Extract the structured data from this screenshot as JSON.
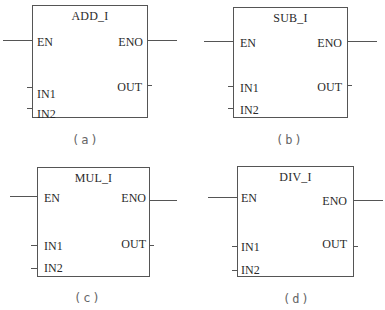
{
  "blocks": [
    {
      "id": "a",
      "title": "ADD_I",
      "caption": "(a)",
      "inputs": {
        "en": "EN",
        "in1": "IN1",
        "in2": "IN2"
      },
      "outputs": {
        "eno": "ENO",
        "out": "OUT"
      }
    },
    {
      "id": "b",
      "title": "SUB_I",
      "caption": "(b)",
      "inputs": {
        "en": "EN",
        "in1": "IN1",
        "in2": "IN2"
      },
      "outputs": {
        "eno": "ENO",
        "out": "OUT"
      }
    },
    {
      "id": "c",
      "title": "MUL_I",
      "caption": "(c)",
      "inputs": {
        "en": "EN",
        "in1": "IN1",
        "in2": "IN2"
      },
      "outputs": {
        "eno": "ENO",
        "out": "OUT"
      }
    },
    {
      "id": "d",
      "title": "DIV_I",
      "caption": "(d)",
      "inputs": {
        "en": "EN",
        "in1": "IN1",
        "in2": "IN2"
      },
      "outputs": {
        "eno": "ENO",
        "out": "OUT"
      }
    }
  ],
  "colors": {
    "line": "#555555",
    "text": "#2a2a2a",
    "caption": "#666666",
    "background": "#ffffff"
  }
}
